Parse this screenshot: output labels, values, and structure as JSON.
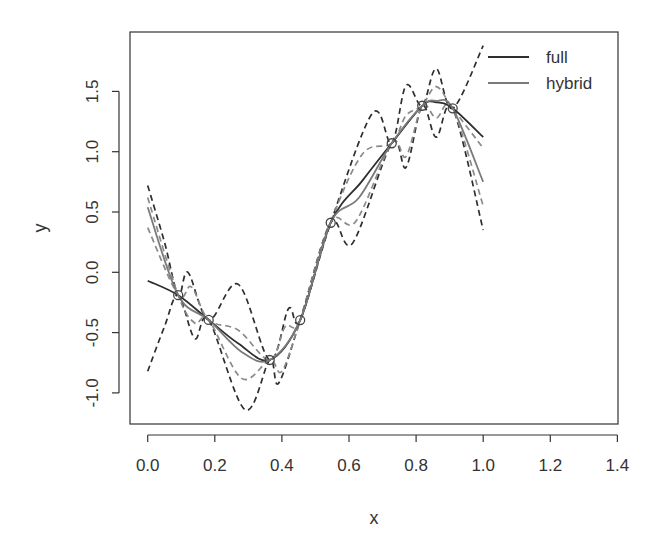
{
  "chart_data": {
    "type": "line",
    "title": "",
    "xlabel": "x",
    "ylabel": "y",
    "xlim": [
      0,
      1.4
    ],
    "ylim": [
      -1.25,
      1.95
    ],
    "x_ticks": [
      "0.0",
      "0.2",
      "0.4",
      "0.6",
      "0.8",
      "1.0",
      "1.2",
      "1.4"
    ],
    "x_tick_values": [
      0,
      0.2,
      0.4,
      0.6,
      0.8,
      1.0,
      1.2,
      1.4
    ],
    "y_ticks": [
      "-1.0",
      "-0.5",
      "0.0",
      "0.5",
      "1.0",
      "1.5"
    ],
    "y_tick_values": [
      -1.0,
      -0.5,
      0.0,
      0.5,
      1.0,
      1.5
    ],
    "grid": false,
    "legend": {
      "position": "top-right",
      "entries": [
        {
          "label": "full",
          "color": "#2e2e2e"
        },
        {
          "label": "hybrid",
          "color": "#7a7a7a"
        }
      ]
    },
    "points": {
      "x": [
        0.0909,
        0.1818,
        0.3636,
        0.4545,
        0.5455,
        0.7273,
        0.8182,
        0.9091
      ],
      "y": [
        -0.19,
        -0.395,
        -0.727,
        -0.396,
        0.411,
        1.07,
        1.381,
        1.36
      ]
    },
    "series": [
      {
        "name": "full",
        "style": "solid",
        "color": "#2e2e2e",
        "x": [
          0,
          0.0909,
          0.1818,
          0.27,
          0.3636,
          0.4545,
          0.5455,
          0.64,
          0.7273,
          0.8182,
          0.86,
          0.9091,
          1.0
        ],
        "y": [
          -0.07,
          -0.19,
          -0.395,
          -0.59,
          -0.727,
          -0.396,
          0.411,
          0.76,
          1.07,
          1.381,
          1.41,
          1.36,
          1.12
        ]
      },
      {
        "name": "hybrid",
        "style": "solid",
        "color": "#7a7a7a",
        "x": [
          0,
          0.0909,
          0.1818,
          0.28,
          0.3636,
          0.4545,
          0.5455,
          0.63,
          0.7273,
          0.8182,
          0.86,
          0.9091,
          1.0
        ],
        "y": [
          0.54,
          -0.19,
          -0.395,
          -0.66,
          -0.727,
          -0.396,
          0.411,
          0.62,
          1.07,
          1.381,
          1.42,
          1.36,
          0.75
        ]
      },
      {
        "name": "full-upper-band",
        "style": "dashed",
        "color": "#2e2e2e",
        "x": [
          0,
          0.05,
          0.0909,
          0.12,
          0.1818,
          0.27,
          0.3636,
          0.42,
          0.4545,
          0.5455,
          0.67,
          0.7273,
          0.77,
          0.8182,
          0.86,
          0.9091,
          1.0
        ],
        "y": [
          0.72,
          0.25,
          -0.19,
          0.0,
          -0.395,
          -0.1,
          -0.727,
          -0.3,
          -0.396,
          0.411,
          1.32,
          1.07,
          1.55,
          1.381,
          1.69,
          1.36,
          1.88
        ]
      },
      {
        "name": "full-lower-band",
        "style": "dashed",
        "color": "#2e2e2e",
        "x": [
          0,
          0.05,
          0.0909,
          0.14,
          0.1818,
          0.29,
          0.3636,
          0.39,
          0.4545,
          0.5455,
          0.61,
          0.7273,
          0.77,
          0.8182,
          0.86,
          0.9091,
          1.0
        ],
        "y": [
          -0.82,
          -0.45,
          -0.19,
          -0.55,
          -0.395,
          -1.14,
          -0.727,
          -0.92,
          -0.396,
          0.411,
          0.24,
          1.07,
          0.87,
          1.381,
          1.12,
          1.36,
          0.35
        ]
      },
      {
        "name": "hybrid-upper-band",
        "style": "dashed",
        "color": "#8a8a8a",
        "x": [
          0,
          0.0909,
          0.13,
          0.1818,
          0.27,
          0.3636,
          0.41,
          0.4545,
          0.5455,
          0.64,
          0.7273,
          0.77,
          0.8182,
          0.86,
          0.9091,
          1.0
        ],
        "y": [
          0.37,
          -0.19,
          -0.12,
          -0.395,
          -0.48,
          -0.727,
          -0.45,
          -0.396,
          0.411,
          0.98,
          1.07,
          1.3,
          1.381,
          1.54,
          1.36,
          1.03
        ]
      },
      {
        "name": "hybrid-lower-band",
        "style": "dashed",
        "color": "#8a8a8a",
        "x": [
          0,
          0.0909,
          0.14,
          0.1818,
          0.28,
          0.3636,
          0.4,
          0.4545,
          0.5455,
          0.62,
          0.7273,
          0.77,
          0.8182,
          0.86,
          0.9091,
          1.0
        ],
        "y": [
          0.62,
          -0.19,
          -0.42,
          -0.395,
          -0.88,
          -0.727,
          -0.82,
          -0.396,
          0.411,
          0.42,
          1.07,
          0.96,
          1.381,
          1.28,
          1.36,
          0.55
        ]
      }
    ]
  }
}
